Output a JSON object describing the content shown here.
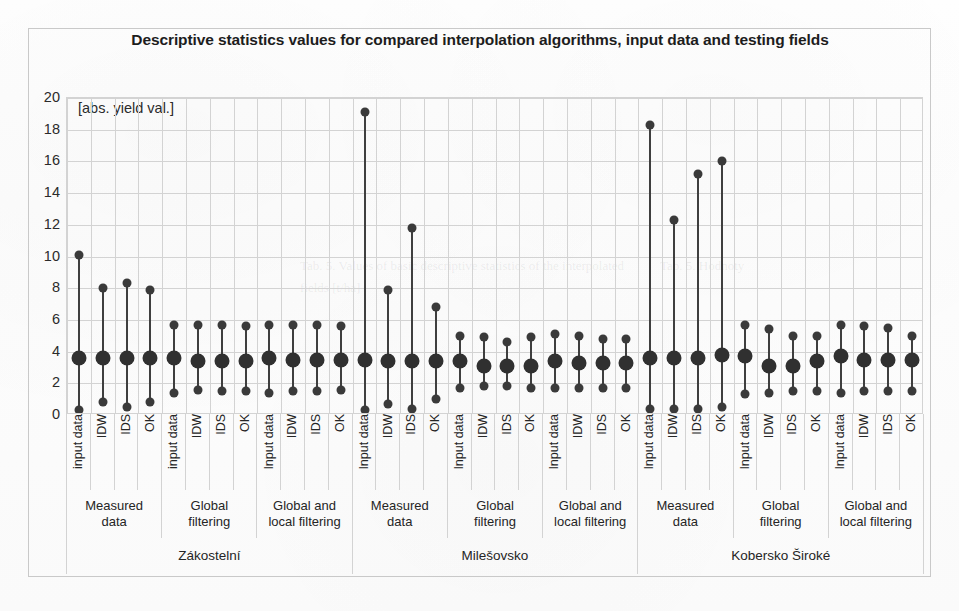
{
  "chart_data": {
    "type": "scatter",
    "title": "Descriptive statistics values for compared interpolation algorithms, input data and testing fields",
    "unit_annotation": "[abs. yield val.]",
    "xlabel": "",
    "ylabel": "",
    "ylim": [
      0,
      20
    ],
    "yticks": [
      0,
      2,
      4,
      6,
      8,
      10,
      12,
      14,
      16,
      18,
      20
    ],
    "grid": true,
    "legend": "none",
    "marker_roles": [
      "maximum",
      "mean",
      "minimum"
    ],
    "fields": [
      "Zákostelní",
      "Milešovsko",
      "Kobersko Široké"
    ],
    "methods": [
      "Measured data",
      "Global filtering",
      "Global and local filtering"
    ],
    "algorithms": [
      "input data",
      "IDW",
      "IDS",
      "OK"
    ],
    "series": [
      {
        "name": "maximum",
        "values": [
          10.1,
          8.0,
          8.3,
          7.9,
          5.7,
          5.7,
          5.7,
          5.6,
          5.7,
          5.7,
          5.7,
          5.6,
          19.1,
          7.9,
          11.8,
          6.8,
          5.0,
          4.9,
          4.6,
          4.9,
          5.1,
          5.0,
          4.8,
          4.8,
          18.3,
          12.3,
          15.2,
          16.0,
          5.7,
          5.4,
          5.0,
          5.0,
          5.7,
          5.6,
          5.5,
          5.0
        ]
      },
      {
        "name": "mean",
        "values": [
          3.6,
          3.6,
          3.6,
          3.6,
          3.6,
          3.4,
          3.4,
          3.4,
          3.6,
          3.5,
          3.5,
          3.5,
          3.5,
          3.4,
          3.4,
          3.4,
          3.4,
          3.1,
          3.1,
          3.1,
          3.4,
          3.3,
          3.3,
          3.3,
          3.6,
          3.6,
          3.6,
          3.8,
          3.7,
          3.1,
          3.1,
          3.4,
          3.7,
          3.5,
          3.5,
          3.5
        ]
      },
      {
        "name": "minimum",
        "values": [
          0.3,
          0.8,
          0.5,
          0.8,
          1.4,
          1.6,
          1.5,
          1.5,
          1.4,
          1.5,
          1.5,
          1.6,
          0.3,
          0.7,
          0.4,
          1.0,
          1.7,
          1.8,
          1.8,
          1.7,
          1.7,
          1.7,
          1.7,
          1.7,
          0.4,
          0.4,
          0.4,
          0.5,
          1.3,
          1.4,
          1.5,
          1.5,
          1.4,
          1.5,
          1.5,
          1.5
        ]
      }
    ],
    "colors": {
      "marker": "#3a3a3a",
      "mean_marker": "#303030",
      "stem": "#3f3f3f",
      "grid": "#d3d3d3",
      "frame": "#c9c9c9",
      "text": "#252525",
      "background": "#ffffff"
    }
  },
  "ghost_text": [
    {
      "text": "Tab. 5. Values of basic descriptive statistics of the interpolated",
      "x": 300,
      "y": 258
    },
    {
      "text": "fields [t/ha]",
      "x": 300,
      "y": 280
    },
    {
      "text": "Tab. 5. Hodnoty",
      "x": 660,
      "y": 258
    }
  ]
}
